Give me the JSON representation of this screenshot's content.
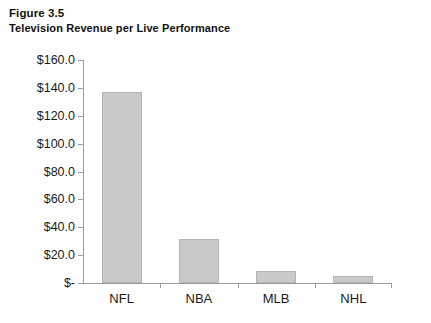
{
  "figure": {
    "number_label": "Figure 3.5",
    "title": "Television Revenue per Live Performance"
  },
  "chart_data": {
    "type": "bar",
    "title": "Television Revenue per Live Performance",
    "subtitle": "Figure 3.5",
    "xlabel": "",
    "ylabel": "",
    "categories": [
      "NFL",
      "NBA",
      "MLB",
      "NHL"
    ],
    "values": [
      137.0,
      31.5,
      8.5,
      5.0
    ],
    "ylim": [
      0,
      160
    ],
    "ytick_values": [
      0,
      20,
      40,
      60,
      80,
      100,
      120,
      140,
      160
    ],
    "ytick_labels": [
      "$-",
      "$20.0",
      "$40.0",
      "$60.0",
      "$80.0",
      "$100.0",
      "$120.0",
      "$140.0",
      "$160.0"
    ],
    "grid": false,
    "legend": "none",
    "series_color": "#c9c9c9",
    "axis_color": "#9a9a9a",
    "units": "millions of dollars"
  }
}
